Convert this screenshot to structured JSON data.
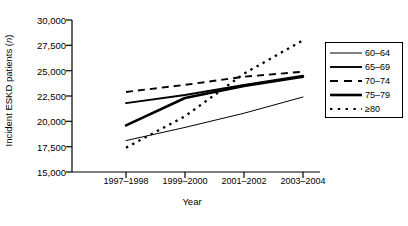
{
  "chart_data": {
    "type": "line",
    "title": "",
    "xlabel": "Year",
    "ylabel": "Incident ESKD patients (n)",
    "ylabel_plain": "Incident ESKD patients (",
    "ylabel_italic": "n",
    "ylabel_close": ")",
    "categories": [
      "1997–1998",
      "1999–2000",
      "2001–2002",
      "2003–2004"
    ],
    "ylim": [
      15000,
      30000
    ],
    "yticks": [
      15000,
      17500,
      20000,
      22500,
      25000,
      27500,
      30000
    ],
    "ytick_labels": [
      "15,000",
      "17,500",
      "20,000",
      "22,500",
      "25,000",
      "27,500",
      "30,000"
    ],
    "grid": false,
    "legend_position": "right-outside",
    "series": [
      {
        "name": "60–64",
        "style": "solid-thin",
        "values": [
          18100,
          19400,
          20800,
          22400
        ]
      },
      {
        "name": "65–69",
        "style": "solid-medium",
        "values": [
          21800,
          22600,
          23600,
          24500
        ]
      },
      {
        "name": "70–74",
        "style": "dashed",
        "values": [
          22900,
          23600,
          24400,
          24900
        ]
      },
      {
        "name": "75–79",
        "style": "solid-thick",
        "values": [
          19600,
          22300,
          23500,
          24400
        ]
      },
      {
        "name": "≥80",
        "style": "dotted",
        "values": [
          17400,
          20500,
          24700,
          28000
        ]
      }
    ]
  },
  "legend": {
    "entries": [
      {
        "label": "60–64"
      },
      {
        "label": "65–69"
      },
      {
        "label": "70–74"
      },
      {
        "label": "75–79"
      },
      {
        "label": "≥80"
      }
    ]
  }
}
